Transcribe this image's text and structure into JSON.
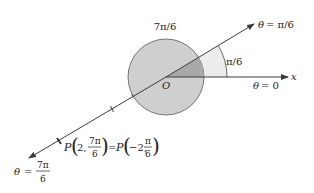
{
  "diagram": {
    "colors": {
      "line": "#3a3a3a",
      "circle_fill": "#cfcfcf",
      "sector_fill": "#a9a9a9",
      "outer_wedge_fill": "#ececec",
      "background": "#ffffff"
    },
    "labels": {
      "top_angle": "7π/6",
      "theta_pi6_var": "θ",
      "theta_pi6_eq": "= π/6",
      "angle_pi6": "π/6",
      "origin": "O",
      "x_axis": "x",
      "theta_zero_var": "θ",
      "theta_zero_eq": "= 0",
      "point_P1": "P",
      "point_P1_r": "2,",
      "point_P1_num": "7π",
      "point_P1_den": "6",
      "equals": "=",
      "point_P2": "P",
      "point_P2_r": "−2,",
      "point_P2_num": "π",
      "point_P2_den": "6",
      "theta_7pi6_var": "θ",
      "theta_7pi6_eq": "=",
      "theta_7pi6_num": "7π",
      "theta_7pi6_den": "6"
    },
    "geometry": {
      "origin": [
        166,
        77
      ],
      "circle_radius": 38,
      "outer_arc_radius": 61,
      "ray_angle": "π/6",
      "point_P_polar": [
        2,
        "7π/6"
      ],
      "point_P_equivalent": [
        -2,
        "π/6"
      ]
    }
  }
}
